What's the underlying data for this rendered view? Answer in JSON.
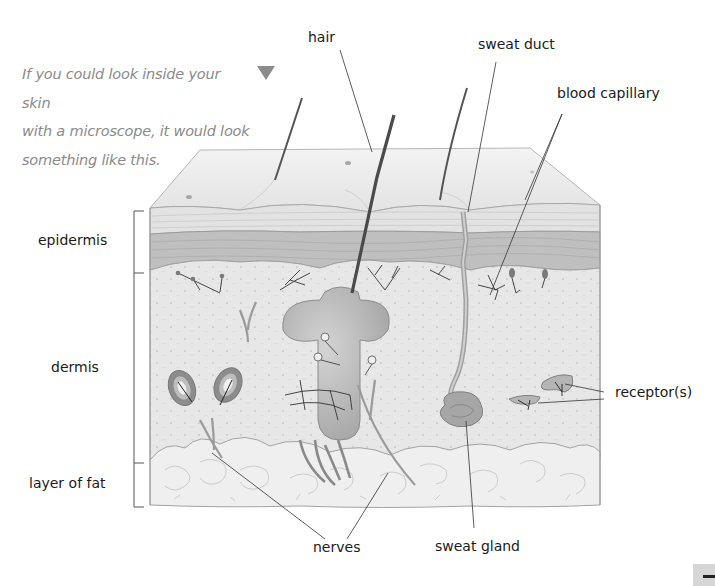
{
  "intro": {
    "lines": [
      "If you could look inside your skin",
      "with a microscope, it would look",
      "something like this."
    ],
    "arrow_icon": "down-triangle-icon",
    "color": "#8a8a8a"
  },
  "labels": {
    "hair": "hair",
    "sweat_duct": "sweat duct",
    "blood_capillary": "blood capillary",
    "epidermis": "epidermis",
    "dermis": "dermis",
    "layer_of_fat": "layer of fat",
    "receptors": "receptor(s)",
    "nerves": "nerves",
    "sweat_gland": "sweat gland"
  },
  "layers": [
    {
      "name": "epidermis",
      "bracket_top": 211,
      "bracket_bottom": 273
    },
    {
      "name": "dermis",
      "bracket_top": 273,
      "bracket_bottom": 463
    },
    {
      "name": "layer of fat",
      "bracket_top": 463,
      "bracket_bottom": 507
    }
  ],
  "colors": {
    "label_text": "#1a1a1a",
    "skin_surface": "#ececec",
    "stratum_corneum": "#dcdcdc",
    "epidermis_band": "#bdbdbd",
    "dermis": "#e6e6e6",
    "fat": "#efefef",
    "structure": "#a9a9a9",
    "leader_line": "#333333"
  }
}
